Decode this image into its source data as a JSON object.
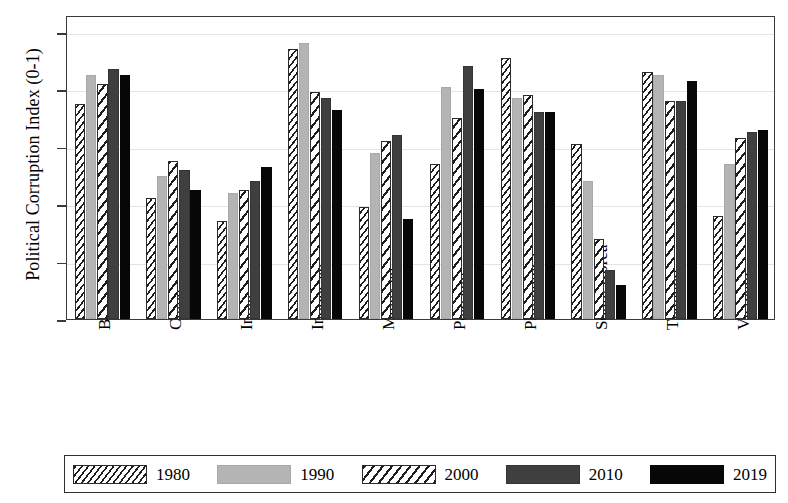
{
  "chart_data": {
    "type": "bar",
    "title": "",
    "xlabel": "",
    "ylabel": "Political Corruption Index (0-1)",
    "ylim": [
      0,
      1
    ],
    "yticks": [
      "0",
      "0.2",
      "0.4",
      "0.6",
      "0.8",
      "1"
    ],
    "grid": "horizontal",
    "legend_position": "bottom",
    "categories": [
      "Bangladesh",
      "China",
      "India",
      "Indonesia",
      "Malaysia",
      "Pakistan",
      "Philippines",
      "South Korea",
      "Thailand",
      "Vietnam"
    ],
    "series": [
      {
        "name": "1980",
        "pattern": "dense-diagonal-hatch",
        "color": "#ffffff",
        "values": [
          0.75,
          0.42,
          0.34,
          0.94,
          0.39,
          0.54,
          0.91,
          0.61,
          0.86,
          0.36
        ]
      },
      {
        "name": "1990",
        "pattern": "solid-light-gray",
        "color": "#b4b4b4",
        "values": [
          0.85,
          0.5,
          0.44,
          0.96,
          0.58,
          0.81,
          0.77,
          0.48,
          0.85,
          0.54
        ]
      },
      {
        "name": "2000",
        "pattern": "wide-diagonal-hatch",
        "color": "#ffffff",
        "values": [
          0.82,
          0.55,
          0.45,
          0.79,
          0.62,
          0.7,
          0.78,
          0.28,
          0.76,
          0.63
        ]
      },
      {
        "name": "2010",
        "pattern": "solid-dark-gray",
        "color": "#3f3f3f",
        "values": [
          0.87,
          0.52,
          0.48,
          0.77,
          0.64,
          0.88,
          0.72,
          0.17,
          0.76,
          0.65
        ]
      },
      {
        "name": "2019",
        "pattern": "solid-black",
        "color": "#070707",
        "values": [
          0.85,
          0.45,
          0.53,
          0.73,
          0.35,
          0.8,
          0.72,
          0.12,
          0.83,
          0.66
        ]
      }
    ]
  },
  "legend": {
    "items": [
      {
        "label": "1980"
      },
      {
        "label": "1990"
      },
      {
        "label": "2000"
      },
      {
        "label": "2010"
      },
      {
        "label": "2019"
      }
    ]
  }
}
